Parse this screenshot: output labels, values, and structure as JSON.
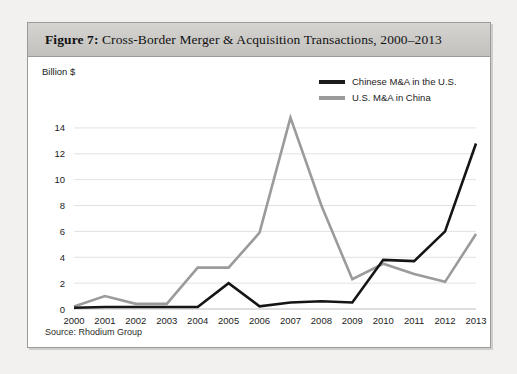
{
  "figure": {
    "number_label": "Figure 7:",
    "title_text": " Cross-Border Merger & Acquisition Transactions, 2000–2013",
    "source_note": "Source: Rhodium Group"
  },
  "legend": {
    "items": [
      {
        "label": "Chinese M&A in the U.S.",
        "color": "#151515",
        "swatch": "dark"
      },
      {
        "label": "U.S. M&A in China",
        "color": "#9b9b9b",
        "swatch": "gray"
      }
    ]
  },
  "chart_data": {
    "type": "line",
    "title": "Cross-Border Merger & Acquisition Transactions, 2000–2013",
    "xlabel": "",
    "ylabel": "Billion $",
    "ylim": [
      0,
      15
    ],
    "yticks": [
      0,
      2,
      4,
      6,
      8,
      10,
      12,
      14
    ],
    "ytick_labels": [
      "0",
      "2",
      "4",
      "6",
      "8",
      "10",
      "12",
      "14"
    ],
    "grid": true,
    "legend_position": "top-right",
    "categories": [
      "2000",
      "2001",
      "2002",
      "2003",
      "2004",
      "2005",
      "2006",
      "2007",
      "2008",
      "2009",
      "2010",
      "2011",
      "2012",
      "2013"
    ],
    "series": [
      {
        "name": "Chinese M&A in the U.S.",
        "color": "#151515",
        "values": [
          0.1,
          0.15,
          0.15,
          0.15,
          0.15,
          2.0,
          0.2,
          0.5,
          0.6,
          0.5,
          3.8,
          3.7,
          6.0,
          12.8
        ]
      },
      {
        "name": "U.S. M&A in China",
        "color": "#9b9b9b",
        "values": [
          0.2,
          1.0,
          0.4,
          0.4,
          3.2,
          3.2,
          5.9,
          14.8,
          8.0,
          2.3,
          3.5,
          2.7,
          2.1,
          5.8
        ]
      }
    ]
  }
}
